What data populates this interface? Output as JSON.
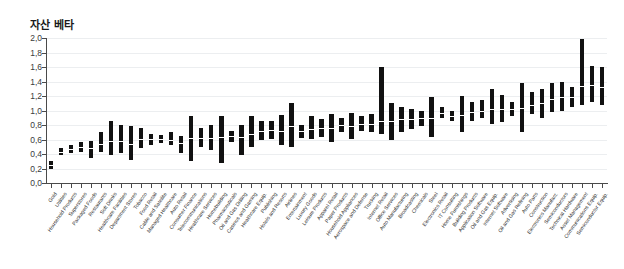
{
  "chart_data": {
    "type": "bar",
    "title": "자산 베타",
    "xlabel": "",
    "ylabel": "",
    "ylim": [
      0.0,
      2.0
    ],
    "ytick_labels": [
      "0,0",
      "0,2",
      "0,4",
      "0,6",
      "0,8",
      "1,0",
      "1,2",
      "1,4",
      "1,6",
      "1,8",
      "2,0"
    ],
    "ytick_values": [
      0.0,
      0.2,
      0.4,
      0.6,
      0.8,
      1.0,
      1.2,
      1.4,
      1.6,
      1.8,
      2.0
    ],
    "grid": true,
    "legend": "none",
    "categories": [
      "Gold",
      "Utilities",
      "Household Products",
      "Superstores",
      "Packaged Foods",
      "Restaurants",
      "Soft Drinks",
      "Healthcare Facilities",
      "Department Stores",
      "Tobacco",
      "Food Retail",
      "Cable and Satellite",
      "Managed Healthcare",
      "Auto Retail",
      "Consumer Finance",
      "Telecommunications",
      "Healthcare Services",
      "Homebuilding",
      "Pharmaceuticals",
      "Oil and Gas Drilling",
      "Casinos and Gaming",
      "Healthcare Equip.",
      "Publishing",
      "Hotels and Resorts",
      "Airlines",
      "Entertainment",
      "Luxury Goods",
      "Leisure Products",
      "Apparel Retail",
      "Paper Products",
      "Household Appliances",
      "Aerospace and Defense",
      "Trucking",
      "Internet Retail",
      "Office Services",
      "Auto Manufacturing",
      "Broadcasting",
      "Chemicals",
      "Steel",
      "Electronics Retail",
      "IT Consulting",
      "Home Furnishings",
      "Building Products",
      "Application Software",
      "Oil and Gas Equip.",
      "Internet Software",
      "Advertising",
      "Oil and Gas Refining",
      "Auto Parts",
      "Construction",
      "Electronics Manufact.",
      "Semiconductors",
      "Technical Hardware",
      "Asset Management",
      "Communications Equip.",
      "Semiconductor Equip."
    ],
    "low": [
      0.2,
      0.38,
      0.42,
      0.43,
      0.35,
      0.43,
      0.38,
      0.42,
      0.32,
      0.48,
      0.52,
      0.55,
      0.53,
      0.42,
      0.3,
      0.5,
      0.45,
      0.28,
      0.57,
      0.38,
      0.5,
      0.6,
      0.6,
      0.52,
      0.5,
      0.62,
      0.6,
      0.64,
      0.57,
      0.7,
      0.6,
      0.72,
      0.7,
      0.67,
      0.6,
      0.7,
      0.74,
      0.78,
      0.64,
      0.9,
      0.85,
      0.7,
      0.86,
      0.9,
      0.82,
      0.84,
      0.92,
      0.7,
      0.95,
      0.9,
      0.98,
      1.0,
      1.05,
      1.08,
      1.12,
      1.08
    ],
    "high": [
      0.3,
      0.48,
      0.52,
      0.56,
      0.58,
      0.7,
      0.85,
      0.8,
      0.78,
      0.76,
      0.68,
      0.66,
      0.7,
      0.65,
      0.92,
      0.76,
      0.8,
      0.92,
      0.72,
      0.8,
      0.92,
      0.85,
      0.86,
      0.94,
      1.1,
      0.8,
      0.92,
      0.88,
      0.95,
      0.9,
      0.96,
      0.92,
      0.95,
      1.6,
      1.1,
      1.05,
      1.02,
      1.0,
      1.18,
      1.05,
      1.0,
      1.2,
      1.12,
      1.15,
      1.3,
      1.22,
      1.12,
      1.38,
      1.25,
      1.3,
      1.38,
      1.4,
      1.32,
      1.98,
      1.62,
      1.6
    ],
    "median": [
      0.25,
      0.43,
      0.47,
      0.49,
      0.48,
      0.54,
      0.58,
      0.58,
      0.54,
      0.6,
      0.6,
      0.6,
      0.6,
      0.55,
      0.62,
      0.62,
      0.62,
      0.64,
      0.65,
      0.63,
      0.68,
      0.72,
      0.73,
      0.72,
      0.78,
      0.72,
      0.74,
      0.76,
      0.76,
      0.8,
      0.79,
      0.82,
      0.82,
      0.85,
      0.86,
      0.88,
      0.88,
      0.89,
      0.9,
      0.96,
      0.93,
      0.94,
      0.98,
      1.0,
      1.02,
      1.02,
      1.02,
      1.04,
      1.08,
      1.1,
      1.16,
      1.18,
      1.18,
      1.34,
      1.35,
      1.32
    ]
  }
}
